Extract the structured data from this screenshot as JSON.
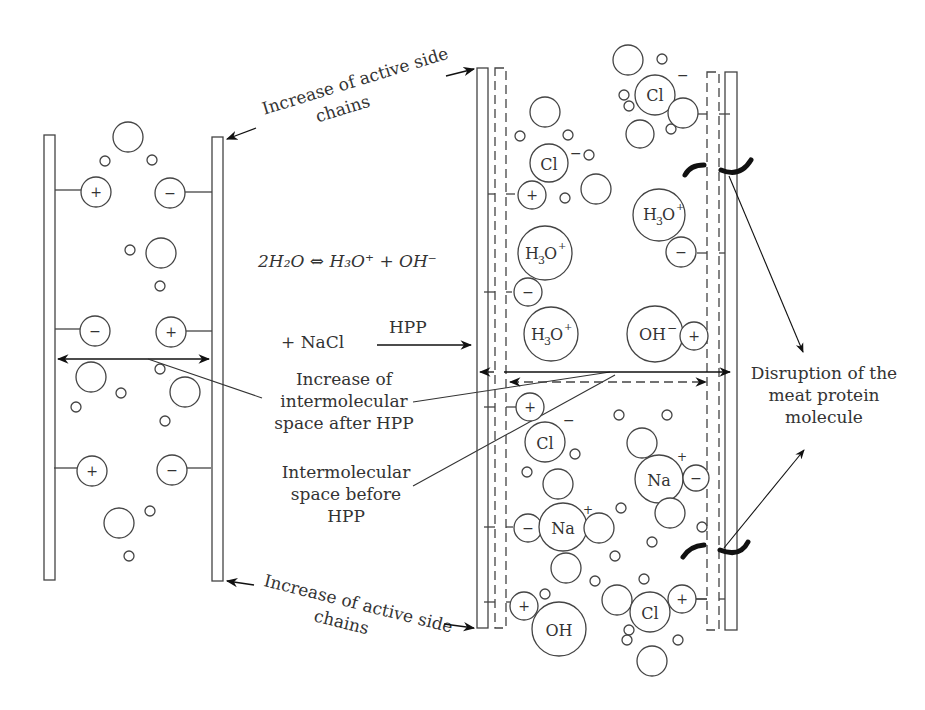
{
  "figure": {
    "labels": {
      "increase_active_side_chains_top": [
        "Increase of active side",
        "chains"
      ],
      "increase_active_side_chains_bottom": [
        "Increase of active side",
        "chains"
      ],
      "equation": "2H₂O ⇔ H₃O⁺ + OH⁻",
      "nacl": "+ NaCl",
      "hpp": "HPP",
      "increase_intermolecular_space": [
        "Increase of",
        "intermolecular",
        "space after HPP"
      ],
      "intermolecular_space_before": [
        "Intermolecular",
        "space before",
        "HPP"
      ],
      "disruption": [
        "Disruption of the",
        "meat protein",
        "molecule"
      ]
    },
    "left_panel": {
      "charges": [
        {
          "sign": "+",
          "side": "left",
          "y": 190
        },
        {
          "sign": "−",
          "side": "right",
          "y": 190
        },
        {
          "sign": "−",
          "side": "left",
          "y": 330
        },
        {
          "sign": "+",
          "side": "right",
          "y": 330
        },
        {
          "sign": "+",
          "side": "left",
          "y": 470
        },
        {
          "sign": "−",
          "side": "right",
          "y": 470
        }
      ]
    },
    "right_panel": {
      "ions": [
        "Cl⁻",
        "Cl⁻",
        "H₃O⁺",
        "H₃O⁺",
        "H₃O⁺",
        "OH⁻",
        "Cl⁻",
        "Na⁺",
        "Na⁺",
        "OH",
        "Cl"
      ],
      "charges": [
        "+",
        "−",
        "−",
        "+",
        "+",
        "−",
        "−",
        "+",
        "+"
      ]
    },
    "text": {
      "plus": "+",
      "minus": "−",
      "cl": "Cl",
      "na": "Na",
      "oh": "OH",
      "oh_minus": "OH",
      "h3o_h": "H",
      "h3o_3": "3",
      "h3o_o": "O",
      "sup_plus": "+",
      "sup_minus": "−"
    }
  }
}
